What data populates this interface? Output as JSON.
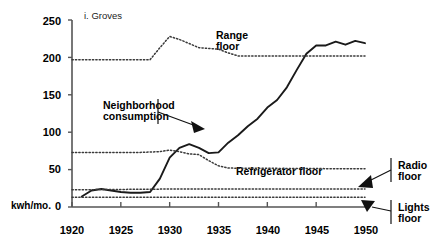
{
  "figure": {
    "title": "i. Groves",
    "unit_label": "kwh/mo.",
    "axis": {
      "ylabel": "",
      "xlabel": "",
      "ylim": [
        0,
        250
      ],
      "xlim": [
        1920,
        1950
      ],
      "yticks": [
        "0",
        "50",
        "100",
        "150",
        "200",
        "250"
      ],
      "ytick_values": [
        0,
        50,
        100,
        150,
        200,
        250
      ],
      "xticks": [
        "1920",
        "1925",
        "1930",
        "1935",
        "1940",
        "1945",
        "1950"
      ],
      "xtick_values": [
        1920,
        1925,
        1930,
        1935,
        1940,
        1945,
        1950
      ],
      "grid": "off"
    },
    "annotations": {
      "range_floor": "Range\nfloor",
      "range_floor_l1": "Range",
      "range_floor_l2": "floor",
      "neighborhood": "Neighborhood\nconsumption",
      "neighborhood_l1": "Neighborhood",
      "neighborhood_l2": "consumption",
      "refrigerator_floor": "Refrigerator floor",
      "radio_floor_l1": "Radio",
      "radio_floor_l2": "floor",
      "lights_floor_l1": "Lights",
      "lights_floor_l2": "floor"
    },
    "colors": {
      "line": "#1a1a1a",
      "dotted": "#3a3a3a",
      "axis": "#555555",
      "text": "#000000",
      "background": "#ffffff"
    }
  },
  "chart_data": {
    "type": "line",
    "title": "i. Groves",
    "xlabel": "",
    "ylabel": "kwh/mo.",
    "xlim": [
      1920,
      1950
    ],
    "ylim": [
      0,
      250
    ],
    "grid": false,
    "legend": "annotated-inline",
    "series": [
      {
        "name": "Neighborhood consumption",
        "style": "solid",
        "x": [
          1921,
          1922,
          1923,
          1924,
          1925,
          1926,
          1927,
          1928,
          1929,
          1930,
          1931,
          1932,
          1933,
          1934,
          1935,
          1936,
          1937,
          1938,
          1939,
          1940,
          1941,
          1942,
          1943,
          1944,
          1945,
          1946,
          1947,
          1948,
          1949,
          1950
        ],
        "y": [
          14,
          22,
          24,
          22,
          20,
          19,
          19,
          20,
          38,
          66,
          79,
          84,
          79,
          72,
          73,
          86,
          96,
          108,
          118,
          133,
          143,
          160,
          183,
          205,
          216,
          216,
          221,
          217,
          222,
          219
        ]
      },
      {
        "name": "Range floor",
        "style": "dotted",
        "x": [
          1920,
          1925,
          1928,
          1929,
          1930,
          1931,
          1933,
          1935,
          1936,
          1937,
          1950
        ],
        "y": [
          197,
          197,
          197,
          213,
          228,
          224,
          213,
          211,
          206,
          202,
          202
        ]
      },
      {
        "name": "Refrigerator floor",
        "style": "dotted",
        "x": [
          1920,
          1927,
          1929,
          1930,
          1931,
          1932,
          1933,
          1934,
          1935,
          1936,
          1950
        ],
        "y": [
          73,
          73,
          74,
          76,
          74,
          71,
          70,
          62,
          55,
          52,
          51
        ]
      },
      {
        "name": "Radio floor",
        "style": "dotted",
        "x": [
          1920,
          1930,
          1940,
          1950
        ],
        "y": [
          23,
          24,
          24,
          24
        ]
      },
      {
        "name": "Lights floor",
        "style": "dotted",
        "x": [
          1920,
          1930,
          1940,
          1950
        ],
        "y": [
          13,
          13,
          13,
          13
        ]
      }
    ]
  }
}
